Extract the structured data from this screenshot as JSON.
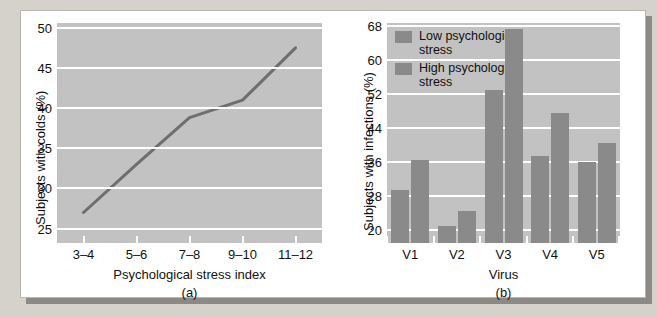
{
  "figure": {
    "panels": [
      {
        "letter": "(a)",
        "xlabel": "Psychological stress index",
        "ylabel": "Subjects with colds (%)"
      },
      {
        "letter": "(b)",
        "xlabel": "Virus",
        "ylabel": "Subjects with infections (%)"
      }
    ]
  },
  "chart_data": [
    {
      "type": "line",
      "title": "",
      "xlabel": "Psychological stress index",
      "ylabel": "Subjects with colds (%)",
      "categories": [
        "3–4",
        "5–6",
        "7–8",
        "9–10",
        "11–12"
      ],
      "values": [
        27.0,
        33.0,
        38.8,
        41.0,
        47.5
      ],
      "ylim": [
        23.2,
        50.6
      ],
      "yticks": [
        50,
        45,
        40,
        35,
        30,
        25
      ],
      "grid": true,
      "legend": "none",
      "line_color": "#6e6e6e"
    },
    {
      "type": "bar",
      "title": "",
      "xlabel": "Virus",
      "ylabel": "Subjects with infections (%)",
      "categories": [
        "V1",
        "V2",
        "V3",
        "V4",
        "V5"
      ],
      "series": [
        {
          "name": "Low psychological stress",
          "values": [
            29.5,
            21.0,
            53.0,
            37.5,
            36.0
          ],
          "color": "#8a8a8a"
        },
        {
          "name": "High psychological stress",
          "values": [
            36.5,
            24.5,
            67.3,
            47.5,
            40.5
          ],
          "color": "#8a8a8a"
        }
      ],
      "ylim": [
        17.0,
        68.8
      ],
      "yticks": [
        68,
        60,
        52,
        44,
        36,
        28,
        20
      ],
      "baseline": 17.0,
      "grid": true,
      "legend": "top-left"
    }
  ],
  "colors": {
    "page_background": "#d5d2cb",
    "card_background": "#ffffff",
    "plot_background": "#c2c2c2",
    "gridline": "#ffffff",
    "bar_fill": "#8a8a8a",
    "line_stroke": "#6e6e6e",
    "shadow": "#8d8a85"
  }
}
